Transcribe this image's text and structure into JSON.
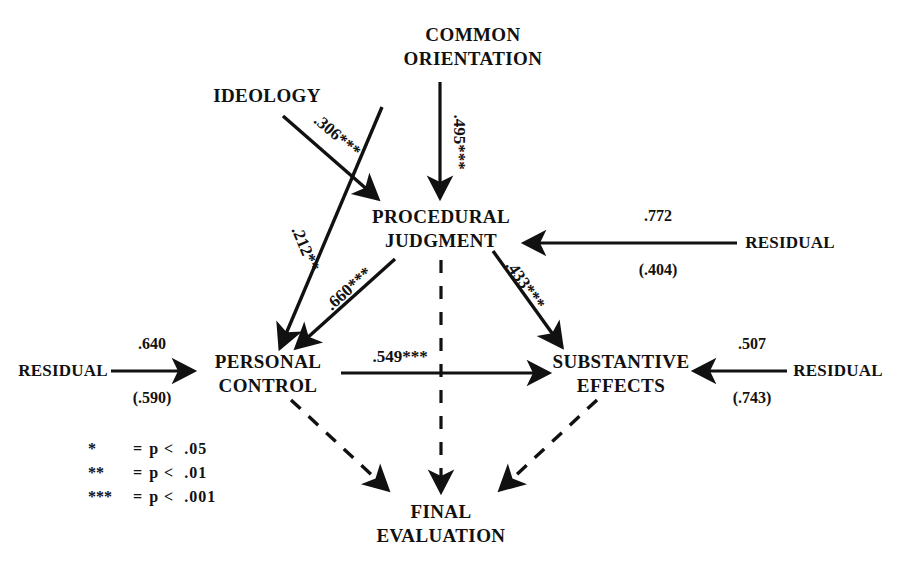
{
  "figure": {
    "type": "path-diagram",
    "background": "#ffffff",
    "ink": "#111111"
  },
  "nodes": [
    {
      "id": "common_orientation",
      "label": "COMMON\nORIENTATION",
      "x": 473,
      "y": 47
    },
    {
      "id": "ideology",
      "label": "IDEOLOGY",
      "x": 267,
      "y": 96
    },
    {
      "id": "procedural_judgment",
      "label": "PROCEDURAL\nJUDGMENT",
      "x": 441,
      "y": 229
    },
    {
      "id": "personal_control",
      "label": "PERSONAL\nCONTROL",
      "x": 268,
      "y": 374
    },
    {
      "id": "substantive_effects",
      "label": "SUBSTANTIVE\nEFFECTS",
      "x": 621,
      "y": 374
    },
    {
      "id": "final_evaluation",
      "label": "FINAL\nEVALUATION",
      "x": 441,
      "y": 524
    },
    {
      "id": "residual_pj",
      "label": "RESIDUAL",
      "x": 790,
      "y": 243
    },
    {
      "id": "residual_pc",
      "label": "RESIDUAL",
      "x": 63,
      "y": 371
    },
    {
      "id": "residual_se",
      "label": "RESIDUAL",
      "x": 838,
      "y": 371
    }
  ],
  "paths": [
    {
      "id": "ideology-to-pj",
      "from": "ideology",
      "to": "procedural_judgment",
      "coef": ".306***",
      "style": "solid"
    },
    {
      "id": "co-to-pj",
      "from": "common_orientation",
      "to": "procedural_judgment",
      "coef": ".495***",
      "style": "solid"
    },
    {
      "id": "co-to-pc",
      "from": "common_orientation",
      "to": "personal_control",
      "coef": ".212**",
      "style": "solid"
    },
    {
      "id": "pj-to-pc",
      "from": "procedural_judgment",
      "to": "personal_control",
      "coef": ".660***",
      "style": "solid"
    },
    {
      "id": "pj-to-se",
      "from": "procedural_judgment",
      "to": "substantive_effects",
      "coef": ".433***",
      "style": "solid"
    },
    {
      "id": "pc-to-se",
      "from": "personal_control",
      "to": "substantive_effects",
      "coef": ".549***",
      "style": "solid"
    },
    {
      "id": "pc-to-fe",
      "from": "personal_control",
      "to": "final_evaluation",
      "coef": "",
      "style": "dashed"
    },
    {
      "id": "pj-to-fe",
      "from": "procedural_judgment",
      "to": "final_evaluation",
      "coef": "",
      "style": "dashed"
    },
    {
      "id": "se-to-fe",
      "from": "substantive_effects",
      "to": "final_evaluation",
      "coef": "",
      "style": "dashed"
    }
  ],
  "residual_paths": [
    {
      "id": "res-to-pj",
      "from": "residual_pj",
      "to": "procedural_judgment",
      "coef": ".772",
      "coef_parenthetical": "(.404)"
    },
    {
      "id": "res-to-pc",
      "from": "residual_pc",
      "to": "personal_control",
      "coef": ".640",
      "coef_parenthetical": "(.590)"
    },
    {
      "id": "res-to-se",
      "from": "residual_se",
      "to": "substantive_effects",
      "coef": ".507",
      "coef_parenthetical": "(.743)"
    }
  ],
  "legend": {
    "rows": [
      {
        "stars": "*",
        "equals": "=",
        "condition": "p <  .05"
      },
      {
        "stars": "**",
        "equals": "=",
        "condition": "p <  .01"
      },
      {
        "stars": "***",
        "equals": "=",
        "condition": "p <  .001"
      }
    ]
  }
}
